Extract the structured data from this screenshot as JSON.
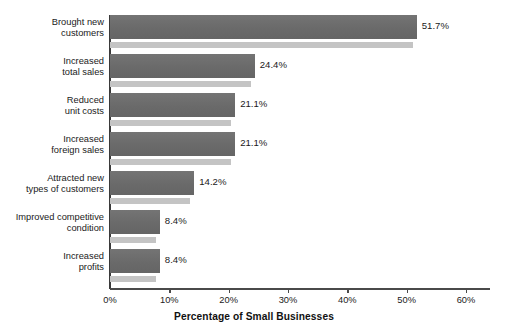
{
  "chart_data": {
    "type": "bar",
    "orientation": "horizontal",
    "title": "",
    "xlabel": "Percentage of Small Businesses",
    "ylabel": "",
    "xlim": [
      0,
      60
    ],
    "grid": false,
    "legend": null,
    "xtick_labels": [
      "0%",
      "10%",
      "20%",
      "30%",
      "40%",
      "50%",
      "60%"
    ],
    "xtick_values": [
      0,
      10,
      20,
      30,
      40,
      50,
      60
    ],
    "categories": [
      "Brought new\ncustomers",
      "Increased\ntotal sales",
      "Reduced\nunit costs",
      "Increased\nforeign sales",
      "Attracted new\ntypes of customers",
      "Improved competitive\ncondition",
      "Increased\nprofits"
    ],
    "values": [
      51.7,
      24.4,
      21.1,
      21.1,
      14.2,
      8.4,
      8.4
    ],
    "value_labels": [
      "51.7%",
      "24.4%",
      "21.1%",
      "21.1%",
      "14.2%",
      "8.4%",
      "8.4%"
    ]
  },
  "style": {
    "bar_color": "#6f6f6f",
    "bar_shadow_color": "#c4c4c4",
    "axis_color": "#4a4a4a",
    "text_color": "#1a1a1a",
    "background": "#ffffff"
  }
}
